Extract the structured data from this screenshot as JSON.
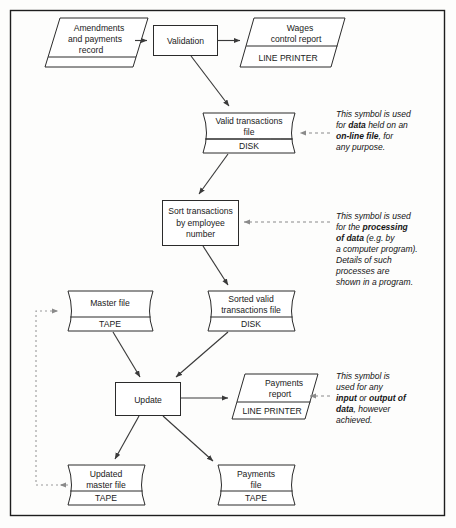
{
  "diagram": {
    "frame": {
      "border_color": "#1e1e1e",
      "background": "#fdfdfc"
    },
    "nodes": [
      {
        "id": "amendments",
        "kind": "input-output-parallelogram",
        "label_lines": [
          "Amendments",
          "and payments",
          "record"
        ],
        "footer": ""
      },
      {
        "id": "validation",
        "kind": "process-rectangle",
        "label_lines": [
          "Validation"
        ],
        "footer": ""
      },
      {
        "id": "wages-report",
        "kind": "input-output-parallelogram",
        "label_lines": [
          "Wages",
          "control report"
        ],
        "footer": "LINE PRINTER"
      },
      {
        "id": "valid-trans",
        "kind": "disk-cylinder",
        "label_lines": [
          "Valid transactions",
          "file"
        ],
        "footer": "DISK"
      },
      {
        "id": "sort-trans",
        "kind": "process-rectangle",
        "label_lines": [
          "Sort transactions",
          "by employee",
          "number"
        ],
        "footer": ""
      },
      {
        "id": "master-file",
        "kind": "disk-cylinder",
        "label_lines": [
          "Master file"
        ],
        "footer": "TAPE"
      },
      {
        "id": "sorted-valid",
        "kind": "disk-cylinder",
        "label_lines": [
          "Sorted valid",
          "transactions file"
        ],
        "footer": "DISK"
      },
      {
        "id": "update",
        "kind": "process-rectangle",
        "label_lines": [
          "Update"
        ],
        "footer": ""
      },
      {
        "id": "payments-report",
        "kind": "input-output-parallelogram",
        "label_lines": [
          "Payments",
          "report"
        ],
        "footer": "LINE PRINTER"
      },
      {
        "id": "updated-master",
        "kind": "disk-cylinder",
        "label_lines": [
          "Updated",
          "master file"
        ],
        "footer": "TAPE"
      },
      {
        "id": "payments-file",
        "kind": "disk-cylinder",
        "label_lines": [
          "Payments",
          "file"
        ],
        "footer": "TAPE"
      }
    ],
    "annotations": [
      {
        "id": "disk-note",
        "target": "valid-trans",
        "lines": [
          [
            {
              "t": "This symbol is used",
              "b": false
            }
          ],
          [
            {
              "t": "for ",
              "b": false
            },
            {
              "t": "data",
              "b": true
            },
            {
              "t": "  held on an",
              "b": false
            }
          ],
          [
            {
              "t": "on-line file",
              "b": true
            },
            {
              "t": ", for",
              "b": false
            }
          ],
          [
            {
              "t": "any purpose.",
              "b": false
            }
          ]
        ]
      },
      {
        "id": "process-note",
        "target": "sort-trans",
        "lines": [
          [
            {
              "t": "This symbol is used",
              "b": false
            }
          ],
          [
            {
              "t": "for the ",
              "b": false
            },
            {
              "t": "processing",
              "b": true
            }
          ],
          [
            {
              "t": "of data",
              "b": true
            },
            {
              "t": " (e.g. by",
              "b": false
            }
          ],
          [
            {
              "t": "a computer program).",
              "b": false
            }
          ],
          [
            {
              "t": "Details of such",
              "b": false
            }
          ],
          [
            {
              "t": "processes are",
              "b": false
            }
          ],
          [
            {
              "t": "shown in a program.",
              "b": false
            }
          ]
        ]
      },
      {
        "id": "io-note",
        "target": "payments-report",
        "lines": [
          [
            {
              "t": "This symbol is",
              "b": false
            }
          ],
          [
            {
              "t": "used for any",
              "b": false
            }
          ],
          [
            {
              "t": "input",
              "b": true
            },
            {
              "t": " or ",
              "b": false
            },
            {
              "t": "output of",
              "b": true
            }
          ],
          [
            {
              "t": "data",
              "b": true
            },
            {
              "t": ", however",
              "b": false
            }
          ],
          [
            {
              "t": "achieved.",
              "b": false
            }
          ]
        ]
      }
    ],
    "edges": [
      {
        "from": "amendments",
        "to": "validation",
        "style": "solid"
      },
      {
        "from": "validation",
        "to": "wages-report",
        "style": "solid"
      },
      {
        "from": "validation",
        "to": "valid-trans",
        "style": "solid"
      },
      {
        "from": "valid-trans",
        "to": "sort-trans",
        "style": "solid"
      },
      {
        "from": "sort-trans",
        "to": "sorted-valid",
        "style": "solid"
      },
      {
        "from": "sorted-valid",
        "to": "update",
        "style": "solid"
      },
      {
        "from": "master-file",
        "to": "update",
        "style": "solid"
      },
      {
        "from": "update",
        "to": "payments-report",
        "style": "solid"
      },
      {
        "from": "update",
        "to": "updated-master",
        "style": "solid"
      },
      {
        "from": "update",
        "to": "payments-file",
        "style": "solid"
      },
      {
        "from": "updated-master",
        "to": "master-file",
        "style": "dotted-feedback"
      }
    ]
  }
}
